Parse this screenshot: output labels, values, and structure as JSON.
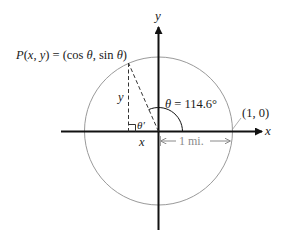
{
  "diagram": {
    "point_label": "P(x, y) = (cos θ, sin θ)",
    "angle_label": "θ = 114.6°",
    "reference_angle_label": "θ′",
    "unit_point_label": "(1, 0)",
    "radius_label": "1 mi.",
    "x_axis_label": "x",
    "y_axis_label": "y",
    "x_leg_label": "x",
    "y_leg_label": "y",
    "angle_degrees": 114.6,
    "colors": {
      "axis": "#111111",
      "circle": "#9a9a9a",
      "dashed": "#333333",
      "annotation": "#8a8a8a"
    }
  }
}
